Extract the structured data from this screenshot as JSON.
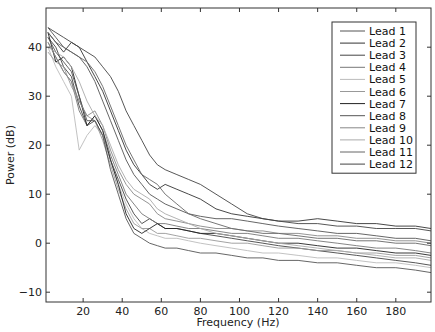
{
  "chart_data": {
    "type": "line",
    "title": "",
    "xlabel": "Frequency (Hz)",
    "ylabel": "Power (dB)",
    "xlim": [
      1,
      198
    ],
    "ylim": [
      -12,
      48
    ],
    "xticks": [
      20,
      40,
      60,
      80,
      100,
      120,
      140,
      160,
      180
    ],
    "yticks": [
      -10,
      0,
      10,
      20,
      30,
      40
    ],
    "grid": false,
    "legend_position": "upper right",
    "x": [
      2,
      6,
      10,
      14,
      18,
      22,
      26,
      30,
      34,
      38,
      42,
      46,
      50,
      54,
      58,
      62,
      68,
      74,
      80,
      88,
      96,
      104,
      112,
      120,
      130,
      140,
      150,
      160,
      170,
      180,
      190,
      198
    ],
    "series": [
      {
        "name": "Lead 1",
        "color": "#555555",
        "values": [
          44,
          42,
          40,
          39,
          38,
          36,
          33,
          29,
          25,
          21,
          17,
          14,
          12,
          10,
          9,
          8,
          7,
          6,
          5.5,
          5,
          5,
          4.5,
          4,
          3.5,
          3,
          2.5,
          2,
          2,
          1.5,
          1,
          1,
          0.5
        ]
      },
      {
        "name": "Lead 2",
        "color": "#333333",
        "values": [
          43,
          41,
          39,
          41,
          40,
          37,
          34,
          31,
          27,
          23,
          19,
          16,
          14,
          12,
          11,
          12,
          11,
          10,
          9,
          7,
          6,
          5.5,
          5,
          4.5,
          4.5,
          5,
          4.5,
          4,
          4,
          3.5,
          3.5,
          3
        ]
      },
      {
        "name": "Lead 3",
        "color": "#444444",
        "values": [
          42,
          40,
          36,
          34,
          28,
          24,
          25,
          22,
          17,
          13,
          9,
          6,
          4,
          5,
          4,
          3,
          3,
          2.5,
          2,
          1.5,
          1,
          0.5,
          0,
          -0.5,
          -1,
          -1.5,
          -2,
          -2.5,
          -3,
          -3.5,
          -4,
          -4.5
        ]
      },
      {
        "name": "Lead 4",
        "color": "#777777",
        "values": [
          41,
          38,
          35,
          33,
          27,
          24,
          26,
          23,
          18,
          14,
          10,
          8,
          6,
          5,
          4,
          4,
          3.5,
          3,
          3,
          2.5,
          2,
          2,
          1.5,
          1,
          1,
          0.5,
          0,
          -0.5,
          -1,
          -1,
          -1.5,
          -2
        ]
      },
      {
        "name": "Lead 5",
        "color": "#bbbbbb",
        "values": [
          40,
          36,
          33,
          30,
          19,
          22,
          24,
          22,
          17,
          12,
          8,
          5,
          3,
          2,
          1.5,
          1,
          1,
          0.5,
          0,
          -0.5,
          -1,
          -1.5,
          -2,
          -2,
          -2.5,
          -3,
          -3,
          -3.5,
          -4,
          -4,
          -4.5,
          -5
        ]
      },
      {
        "name": "Lead 6",
        "color": "#999999",
        "values": [
          39,
          37,
          36,
          32,
          29,
          26,
          25,
          21,
          16,
          11,
          7,
          4,
          3,
          3,
          2,
          2,
          1.5,
          1,
          1,
          0.5,
          0,
          0,
          -0.5,
          -1,
          -1,
          -1.5,
          -1.5,
          -2,
          -2,
          -2.5,
          -2.5,
          -3
        ]
      },
      {
        "name": "Lead 7",
        "color": "#222222",
        "values": [
          43,
          37,
          38,
          36,
          30,
          24,
          26,
          23,
          17,
          12,
          6,
          3,
          2,
          3,
          4,
          3,
          3,
          2.5,
          2,
          2,
          1.5,
          1,
          0.5,
          0,
          0,
          -0.5,
          -1,
          -1,
          -1.5,
          -2,
          -2,
          -2.5
        ]
      },
      {
        "name": "Lead 8",
        "color": "#555555",
        "values": [
          42,
          39,
          37,
          35,
          30,
          25,
          25,
          22,
          15,
          10,
          5,
          2,
          1,
          0,
          -0.5,
          -1,
          -1,
          -1.5,
          -2,
          -2,
          -2.5,
          -3,
          -3,
          -3.5,
          -3.5,
          -4,
          -4,
          -4.5,
          -5,
          -5,
          -5.5,
          -6
        ]
      },
      {
        "name": "Lead 9",
        "color": "#888888",
        "values": [
          41,
          38,
          35,
          33,
          29,
          26,
          27,
          24,
          19,
          15,
          12,
          10,
          9,
          8,
          6,
          5,
          4.5,
          4,
          3.5,
          3,
          3,
          2.5,
          2.5,
          2,
          2,
          1.5,
          1.5,
          1,
          1,
          0.5,
          0.5,
          0
        ]
      },
      {
        "name": "Lead 10",
        "color": "#aaaaaa",
        "values": [
          40,
          39,
          38,
          36,
          33,
          29,
          26,
          24,
          20,
          16,
          13,
          11,
          10,
          9,
          7,
          6,
          5,
          4,
          3,
          2,
          1.5,
          1,
          0.5,
          0,
          -0.5,
          -1,
          -1.5,
          -2,
          -2.5,
          -3,
          -3,
          -3.5
        ]
      },
      {
        "name": "Lead 11",
        "color": "#666666",
        "values": [
          43,
          41,
          40,
          39,
          38,
          37,
          35,
          32,
          28,
          24,
          20,
          17,
          14,
          13,
          12,
          10,
          8,
          6,
          5,
          4,
          3,
          2.5,
          2,
          2,
          1.5,
          1,
          1,
          0.5,
          0.5,
          0,
          0,
          -0.5
        ]
      },
      {
        "name": "Lead 12",
        "color": "#444444",
        "values": [
          44,
          43,
          42,
          41,
          40,
          39,
          38,
          36,
          34,
          31,
          27,
          24,
          21,
          18,
          16,
          15,
          14,
          13,
          12,
          10,
          8,
          6,
          5,
          4.5,
          4,
          4,
          3.5,
          3.5,
          3,
          3,
          3,
          2.5
        ]
      }
    ]
  }
}
